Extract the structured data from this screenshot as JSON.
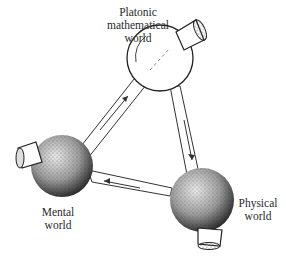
{
  "diagram": {
    "nodes": [
      {
        "id": "platonic",
        "label_lines": [
          "Platonic",
          "mathematical",
          "world"
        ],
        "style": "clear-sphere"
      },
      {
        "id": "mental",
        "label_lines": [
          "Mental",
          "world"
        ],
        "style": "textured-sphere"
      },
      {
        "id": "physical",
        "label_lines": [
          "Physical",
          "world"
        ],
        "style": "textured-sphere"
      }
    ],
    "edges": [
      {
        "from": "mental",
        "to": "platonic"
      },
      {
        "from": "platonic",
        "to": "physical"
      },
      {
        "from": "physical",
        "to": "mental"
      }
    ]
  }
}
